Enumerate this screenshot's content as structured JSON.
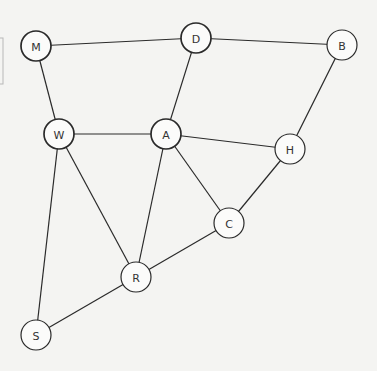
{
  "diagram": {
    "type": "undirected-graph",
    "node_radius": 15,
    "nodes": [
      {
        "id": "M",
        "label": "M",
        "x": 36,
        "y": 46,
        "bold": true
      },
      {
        "id": "D",
        "label": "D",
        "x": 196,
        "y": 38,
        "bold": true
      },
      {
        "id": "B",
        "label": "B",
        "x": 342,
        "y": 45,
        "bold": false
      },
      {
        "id": "W",
        "label": "W",
        "x": 59,
        "y": 134,
        "bold": true
      },
      {
        "id": "A",
        "label": "A",
        "x": 166,
        "y": 134,
        "bold": true
      },
      {
        "id": "H",
        "label": "H",
        "x": 290,
        "y": 149,
        "bold": false
      },
      {
        "id": "C",
        "label": "C",
        "x": 229,
        "y": 223,
        "bold": false
      },
      {
        "id": "R",
        "label": "R",
        "x": 136,
        "y": 277,
        "bold": false
      },
      {
        "id": "S",
        "label": "S",
        "x": 36,
        "y": 335,
        "bold": false
      }
    ],
    "edges": [
      [
        "M",
        "D"
      ],
      [
        "D",
        "B"
      ],
      [
        "M",
        "W"
      ],
      [
        "D",
        "A"
      ],
      [
        "W",
        "A"
      ],
      [
        "A",
        "H"
      ],
      [
        "B",
        "H"
      ],
      [
        "A",
        "C"
      ],
      [
        "H",
        "C"
      ],
      [
        "W",
        "R"
      ],
      [
        "A",
        "R"
      ],
      [
        "C",
        "R"
      ],
      [
        "W",
        "S"
      ],
      [
        "R",
        "S"
      ]
    ]
  }
}
